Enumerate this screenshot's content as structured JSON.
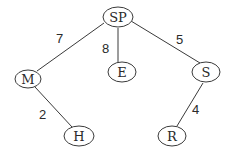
{
  "diagram": {
    "type": "weighted-tree",
    "nodes": [
      {
        "id": "SP",
        "label": "SP"
      },
      {
        "id": "M",
        "label": "M"
      },
      {
        "id": "E",
        "label": "E"
      },
      {
        "id": "S",
        "label": "S"
      },
      {
        "id": "H",
        "label": "H"
      },
      {
        "id": "R",
        "label": "R"
      }
    ],
    "edges": [
      {
        "from": "SP",
        "to": "M",
        "weight": "7"
      },
      {
        "from": "SP",
        "to": "E",
        "weight": "8"
      },
      {
        "from": "SP",
        "to": "S",
        "weight": "5"
      },
      {
        "from": "M",
        "to": "H",
        "weight": "2"
      },
      {
        "from": "S",
        "to": "R",
        "weight": "4"
      }
    ]
  }
}
